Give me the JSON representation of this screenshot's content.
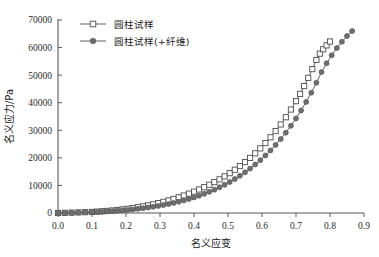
{
  "chart_data": {
    "type": "line",
    "title": "",
    "xlabel": "名义应变",
    "ylabel": "名义应力/Pa",
    "xlim": [
      0.0,
      0.9
    ],
    "ylim": [
      0,
      70000
    ],
    "xticks": [
      "0.0",
      "0.1",
      "0.2",
      "0.3",
      "0.4",
      "0.5",
      "0.6",
      "0.7",
      "0.8",
      "0.9"
    ],
    "xtick_values": [
      0.0,
      0.1,
      0.2,
      0.3,
      0.4,
      0.5,
      0.6,
      0.7,
      0.8,
      0.9
    ],
    "yticks": [
      "0",
      "10000",
      "20000",
      "30000",
      "40000",
      "50000",
      "60000",
      "70000"
    ],
    "ytick_values": [
      0,
      10000,
      20000,
      30000,
      40000,
      50000,
      60000,
      70000
    ],
    "grid": false,
    "legend_position": "top-left-inside",
    "series": [
      {
        "name": "圆柱试样",
        "marker": "open-square",
        "color": "#4d4d4d",
        "x": [
          0.0,
          0.02,
          0.04,
          0.06,
          0.08,
          0.1,
          0.115,
          0.13,
          0.145,
          0.16,
          0.175,
          0.19,
          0.205,
          0.22,
          0.235,
          0.25,
          0.265,
          0.28,
          0.295,
          0.31,
          0.325,
          0.34,
          0.355,
          0.37,
          0.385,
          0.4,
          0.415,
          0.43,
          0.445,
          0.46,
          0.475,
          0.49,
          0.505,
          0.52,
          0.535,
          0.55,
          0.565,
          0.58,
          0.595,
          0.61,
          0.625,
          0.64,
          0.655,
          0.67,
          0.685,
          0.7,
          0.712,
          0.724,
          0.736,
          0.748,
          0.76,
          0.77,
          0.78,
          0.79,
          0.8
        ],
        "y": [
          0,
          60,
          130,
          210,
          300,
          400,
          500,
          620,
          760,
          920,
          1100,
          1310,
          1540,
          1800,
          2090,
          2410,
          2760,
          3150,
          3580,
          4050,
          4560,
          5110,
          5700,
          6340,
          7020,
          7750,
          8530,
          9360,
          10250,
          11200,
          12210,
          13290,
          14450,
          15690,
          17020,
          18450,
          19990,
          21650,
          23440,
          25370,
          27450,
          29700,
          32120,
          34730,
          37540,
          40560,
          43230,
          46050,
          49030,
          52180,
          55500,
          57800,
          59400,
          60800,
          62200
        ]
      },
      {
        "name": "圆柱试样(+纤维)",
        "marker": "filled-circle",
        "color": "#6e6e6e",
        "x": [
          0.0,
          0.02,
          0.04,
          0.06,
          0.08,
          0.1,
          0.115,
          0.13,
          0.145,
          0.16,
          0.175,
          0.19,
          0.205,
          0.22,
          0.235,
          0.25,
          0.265,
          0.28,
          0.295,
          0.31,
          0.325,
          0.34,
          0.355,
          0.37,
          0.385,
          0.4,
          0.415,
          0.43,
          0.445,
          0.46,
          0.475,
          0.49,
          0.505,
          0.52,
          0.535,
          0.55,
          0.565,
          0.58,
          0.595,
          0.61,
          0.625,
          0.64,
          0.655,
          0.67,
          0.685,
          0.7,
          0.715,
          0.73,
          0.745,
          0.76,
          0.775,
          0.79,
          0.805,
          0.82,
          0.835,
          0.85,
          0.865
        ],
        "y": [
          0,
          50,
          110,
          180,
          250,
          330,
          400,
          490,
          590,
          700,
          830,
          970,
          1130,
          1310,
          1510,
          1730,
          1980,
          2250,
          2550,
          2880,
          3240,
          3640,
          4080,
          4560,
          5080,
          5650,
          6270,
          6940,
          7670,
          8460,
          9310,
          10230,
          11230,
          12310,
          13480,
          14740,
          16100,
          17570,
          19150,
          20860,
          22700,
          24680,
          26820,
          29130,
          31620,
          34300,
          37190,
          40300,
          43650,
          47250,
          51100,
          54300,
          57200,
          59800,
          62100,
          64200,
          66000
        ]
      }
    ]
  },
  "legend": {
    "entries": [
      {
        "label": "圆柱试样"
      },
      {
        "label": "圆柱试样(+纤维)"
      }
    ]
  }
}
